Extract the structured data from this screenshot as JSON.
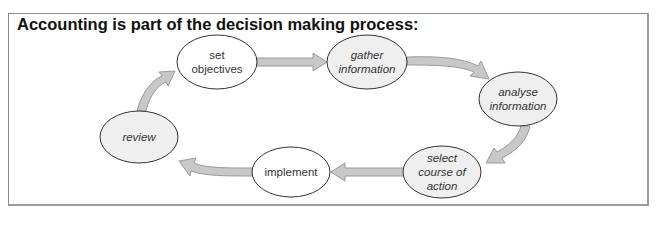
{
  "title": "Accounting is part of the decision making process:",
  "colors": {
    "frame_border": "#8a8a8a",
    "arrow_fill": "#c8c8c8",
    "arrow_stroke": "#9a9a9a",
    "node_white": "#ffffff",
    "node_gray": "#efefef",
    "node_stroke": "#333333"
  },
  "nodes": [
    {
      "id": "set-objectives",
      "line1": "set",
      "line2": "objectives",
      "line3": "",
      "style": "white-regular"
    },
    {
      "id": "gather-information",
      "line1": "gather",
      "line2": "information",
      "line3": "",
      "style": "gray-italic"
    },
    {
      "id": "analyse-information",
      "line1": "analyse",
      "line2": "information",
      "line3": "",
      "style": "gray-italic"
    },
    {
      "id": "select-course-of-action",
      "line1": "select",
      "line2": "course of",
      "line3": "action",
      "style": "gray-italic"
    },
    {
      "id": "implement",
      "line1": "implement",
      "line2": "",
      "line3": "",
      "style": "white-regular"
    },
    {
      "id": "review",
      "line1": "review",
      "line2": "",
      "line3": "",
      "style": "gray-italic"
    }
  ],
  "flow": [
    {
      "from": "set objectives",
      "to": "gather information"
    },
    {
      "from": "gather information",
      "to": "analyse information"
    },
    {
      "from": "analyse information",
      "to": "select course of action"
    },
    {
      "from": "select course of action",
      "to": "implement"
    },
    {
      "from": "implement",
      "to": "review"
    },
    {
      "from": "review",
      "to": "set objectives"
    }
  ]
}
